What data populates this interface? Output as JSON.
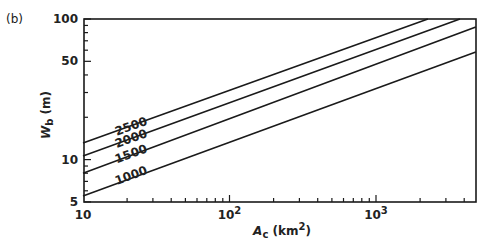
{
  "panel_label": "(b)",
  "chart_data": {
    "type": "line",
    "title": "",
    "xlabel": "A_c (km^2)",
    "ylabel": "W_b (m)",
    "xscale": "log",
    "yscale": "log",
    "xlim": [
      10,
      4800
    ],
    "ylim": [
      5,
      100
    ],
    "grid": false,
    "x_tick_labels": [
      {
        "value": 10,
        "label": "10"
      },
      {
        "value": 100,
        "label": "10",
        "sup": "2"
      },
      {
        "value": 1000,
        "label": "10",
        "sup": "3"
      }
    ],
    "y_tick_labels": [
      {
        "value": 5,
        "label": "5"
      },
      {
        "value": 10,
        "label": "10"
      },
      {
        "value": 50,
        "label": "50"
      },
      {
        "value": 100,
        "label": "100"
      }
    ],
    "series": [
      {
        "name": "2500",
        "x": [
          10,
          2260
        ],
        "y": [
          13.1,
          100
        ],
        "label_at": [
          17,
          14.8
        ]
      },
      {
        "name": "2000",
        "x": [
          10,
          3740
        ],
        "y": [
          10.6,
          100
        ],
        "label_at": [
          17,
          12.1
        ]
      },
      {
        "name": "1500",
        "x": [
          10,
          4800
        ],
        "y": [
          8.0,
          87.7
        ],
        "label_at": [
          17,
          9.4
        ]
      },
      {
        "name": "1000",
        "x": [
          10,
          4800
        ],
        "y": [
          5.5,
          58.2
        ],
        "label_at": [
          17,
          6.6
        ]
      }
    ]
  },
  "colors": {
    "line": "#1a1a1a",
    "background": "#ffffff"
  }
}
